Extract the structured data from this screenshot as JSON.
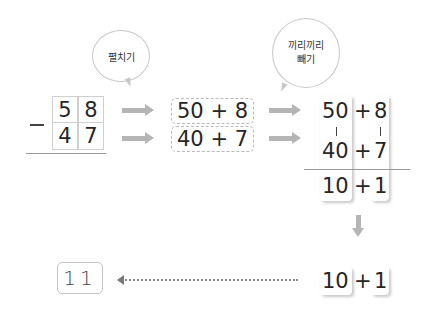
{
  "bubbles": {
    "left": "펼치기",
    "right_line1": "끼리끼리",
    "right_line2": "빼기"
  },
  "vertical_problem": {
    "top": [
      "5",
      "8"
    ],
    "bottom": [
      "4",
      "7"
    ],
    "operator": "−"
  },
  "expanded": {
    "row1": "50 + 8",
    "row2": "40 + 7"
  },
  "column_subtraction": {
    "tens_top": "50",
    "ones_top": "8",
    "tens_bottom": "40",
    "ones_bottom": "7",
    "plus": "+",
    "tens_result": "10",
    "ones_result": "1",
    "connector": "|"
  },
  "final": {
    "tens": "10",
    "plus": "+",
    "ones": "1",
    "answer": "11"
  },
  "colors": {
    "arrow": "#b5b5b5",
    "dotted_arrow": "#777777",
    "line": "#9a9a9a"
  }
}
